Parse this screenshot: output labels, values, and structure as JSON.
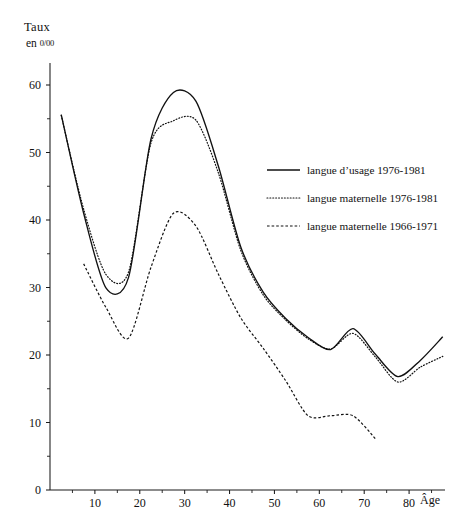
{
  "figure": {
    "y_axis_title": "Taux",
    "y_axis_subtitle_prefix": "en",
    "y_axis_subtitle_unit": "0/00",
    "x_axis_label": "Âge"
  },
  "legend": {
    "items": [
      {
        "label": "langue d’usage 1976-1981",
        "style": "solid"
      },
      {
        "label": "langue maternelle 1976-1981",
        "style": "dotted"
      },
      {
        "label": "langue maternelle 1966-1971",
        "style": "dashed"
      }
    ]
  },
  "chart_data": {
    "type": "line",
    "title": "Taux",
    "subtitle": "en 0/00",
    "xlabel": "Âge",
    "ylabel": "Taux en 0/00",
    "xlim": [
      0,
      88
    ],
    "ylim": [
      0,
      64
    ],
    "grid": false,
    "legend_position": "center-right",
    "x_ticks_major": [
      10,
      20,
      30,
      40,
      50,
      60,
      70,
      80
    ],
    "x_ticks_minor": [
      5,
      15,
      25,
      35,
      45,
      55,
      65,
      75,
      85
    ],
    "x_tick_labels": [
      "10",
      "20",
      "30",
      "40",
      "50",
      "60",
      "70",
      "80"
    ],
    "y_ticks_major": [
      0,
      10,
      20,
      30,
      40,
      50,
      60
    ],
    "y_ticks_minor": [
      5,
      15,
      25,
      35,
      45,
      55
    ],
    "y_tick_labels": [
      "0",
      "10",
      "20",
      "30",
      "40",
      "50",
      "60"
    ],
    "series": [
      {
        "name": "langue d’usage 1976-1981",
        "style": "solid",
        "x": [
          2.5,
          7.5,
          12.5,
          17.5,
          22.5,
          27.5,
          32.5,
          37.5,
          42.5,
          47.5,
          52.5,
          57.5,
          62.5,
          67.5,
          72.5,
          77.5,
          82.5,
          87.5
        ],
        "values": [
          55.6,
          41.0,
          29.9,
          31.5,
          52.0,
          58.9,
          57.6,
          48.0,
          36.0,
          29.3,
          25.4,
          22.6,
          20.8,
          23.9,
          20.1,
          16.8,
          19.2,
          22.7
        ]
      },
      {
        "name": "langue maternelle 1976-1981",
        "style": "dotted",
        "x": [
          2.5,
          7.5,
          12.5,
          17.5,
          22.5,
          27.5,
          32.5,
          37.5,
          42.5,
          47.5,
          52.5,
          57.5,
          62.5,
          67.5,
          72.5,
          77.5,
          82.5,
          87.5
        ],
        "values": [
          55.5,
          41.6,
          31.9,
          32.3,
          51.4,
          54.7,
          54.8,
          47.0,
          35.5,
          28.9,
          25.2,
          22.4,
          20.9,
          23.2,
          19.7,
          16.0,
          18.2,
          19.8
        ]
      },
      {
        "name": "langue maternelle 1966-1971",
        "style": "dashed",
        "x": [
          7.5,
          12.5,
          17.5,
          22.5,
          27.5,
          32.5,
          37.5,
          42.5,
          47.5,
          52.5,
          57.5,
          62.5,
          67.5,
          72.5
        ],
        "values": [
          33.5,
          27.0,
          22.5,
          33.0,
          41.0,
          39.1,
          32.0,
          25.5,
          21.0,
          16.2,
          11.0,
          11.0,
          11.0,
          7.6
        ]
      }
    ]
  }
}
